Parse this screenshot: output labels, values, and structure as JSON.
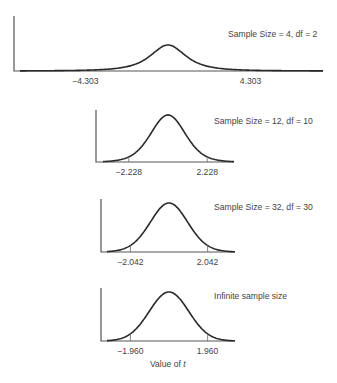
{
  "chart_data": [
    {
      "type": "line",
      "title": "Sample Size = 4, df = 2",
      "sample_size": 4,
      "df": 2,
      "critical_values": [
        -4.303,
        4.303
      ],
      "tick_labels": [
        "−4.303",
        "4.303"
      ],
      "series": [
        {
          "name": "t distribution (df=2)",
          "function": "student_t_pdf",
          "df": 2
        }
      ],
      "xlabel": "",
      "ylabel": "",
      "layout": {
        "axis_x": 14,
        "axis_top": 16,
        "baseline_y": 71,
        "x_start": 20,
        "x_end": 323,
        "center_x": 168,
        "px_per_unit": 19.2,
        "peak_px": 26,
        "title_x": 228,
        "title_y": 37,
        "label_y": 84
      }
    },
    {
      "type": "line",
      "title": "Sample Size = 12, df = 10",
      "sample_size": 12,
      "df": 10,
      "critical_values": [
        -2.228,
        2.228
      ],
      "tick_labels": [
        "−2.228",
        "2.228"
      ],
      "series": [
        {
          "name": "t distribution (df=10)",
          "function": "student_t_pdf",
          "df": 10
        }
      ],
      "xlabel": "",
      "ylabel": "",
      "layout": {
        "axis_x": 96,
        "axis_top": 110,
        "baseline_y": 162,
        "x_start": 103,
        "x_end": 234,
        "center_x": 168,
        "px_per_unit": 17.6,
        "peak_px": 47,
        "title_x": 214,
        "title_y": 124,
        "label_y": 175
      }
    },
    {
      "type": "line",
      "title": "Sample Size = 32, df = 30",
      "sample_size": 32,
      "df": 30,
      "critical_values": [
        -2.042,
        2.042
      ],
      "tick_labels": [
        "−2.042",
        "2.042"
      ],
      "series": [
        {
          "name": "t distribution (df=30)",
          "function": "student_t_pdf",
          "df": 30
        }
      ],
      "xlabel": "",
      "ylabel": "",
      "layout": {
        "axis_x": 101,
        "axis_top": 199,
        "baseline_y": 252,
        "x_start": 107,
        "x_end": 235,
        "center_x": 169,
        "px_per_unit": 18.9,
        "peak_px": 49,
        "title_x": 214,
        "title_y": 210,
        "label_y": 265
      }
    },
    {
      "type": "line",
      "title": "Infinite sample size",
      "sample_size": "infinite",
      "df": "infinity",
      "critical_values": [
        -1.96,
        1.96
      ],
      "tick_labels": [
        "−1.960",
        "1.960"
      ],
      "series": [
        {
          "name": "standard normal",
          "function": "normal_pdf"
        }
      ],
      "xlabel": "Value of t",
      "ylabel": "",
      "layout": {
        "axis_x": 101,
        "axis_top": 288,
        "baseline_y": 341,
        "x_start": 107,
        "x_end": 235,
        "center_x": 169,
        "px_per_unit": 19.7,
        "peak_px": 49,
        "title_x": 214,
        "title_y": 299,
        "label_y": 354
      }
    }
  ],
  "xlabel": {
    "prefix": "Value of ",
    "var": "t",
    "x": 150,
    "y": 367
  },
  "colors": {
    "curve": "#2a2a2a",
    "axis": "#555555",
    "tick": "#777777",
    "text": "#444444",
    "background": "#ffffff"
  }
}
